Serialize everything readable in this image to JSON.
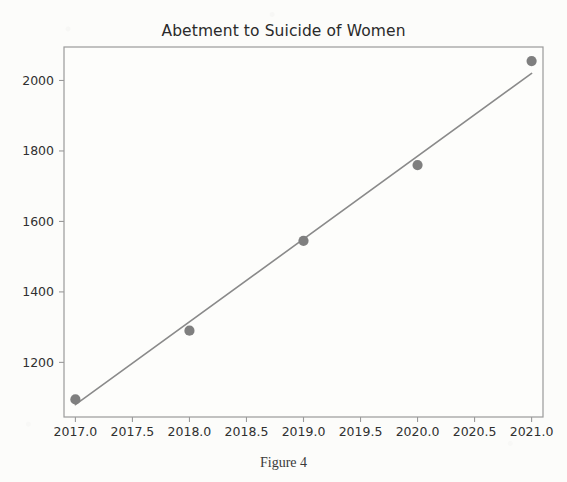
{
  "figure": {
    "title": "Abetment to Suicide of Women",
    "caption": "Figure 4"
  },
  "chart_data": {
    "type": "scatter",
    "title": "Abetment to Suicide of Women",
    "caption": "Figure 4",
    "xlabel": "",
    "ylabel": "",
    "x": [
      2017,
      2018,
      2019,
      2020,
      2021
    ],
    "values": [
      1095,
      1290,
      1545,
      1760,
      2055
    ],
    "series": [
      {
        "name": "Abetment to suicide of women (cases)",
        "type": "scatter",
        "marker": "circle",
        "color": "#7f7f7f",
        "x": [
          2017,
          2018,
          2019,
          2020,
          2021
        ],
        "values": [
          1095,
          1290,
          1545,
          1760,
          2055
        ]
      },
      {
        "name": "Linear trend line",
        "type": "line",
        "color": "#8a8a8a",
        "x": [
          2017,
          2021
        ],
        "values": [
          1080,
          2020
        ]
      }
    ],
    "xlim": [
      2016.9,
      2021.1
    ],
    "ylim": [
      1045,
      2095
    ],
    "xticks": [
      2017.0,
      2017.5,
      2018.0,
      2018.5,
      2019.0,
      2019.5,
      2020.0,
      2020.5,
      2021.0
    ],
    "xticklabels": [
      "2017.0",
      "2017.5",
      "2018.0",
      "2018.5",
      "2019.0",
      "2019.5",
      "2020.0",
      "2020.5",
      "2021.0"
    ],
    "yticks": [
      1200,
      1400,
      1600,
      1800,
      2000
    ],
    "yticklabels": [
      "1200",
      "1400",
      "1600",
      "1800",
      "2000"
    ],
    "grid": false,
    "legend": "none",
    "annotations": []
  },
  "axes_geometry": {
    "left": 64,
    "right": 543,
    "top": 47,
    "bottom": 417,
    "frame_color": "#9a9a9a",
    "background": "#fdfdfb"
  }
}
